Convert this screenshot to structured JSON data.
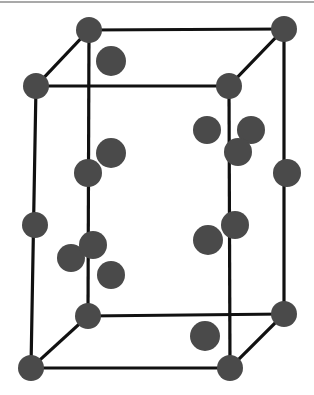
{
  "diagram": {
    "title": "",
    "type": "crystal-unit-cell",
    "colors": {
      "background": "#ffffff",
      "edge": "#111111",
      "atom": "#4a4a4a",
      "top_rule": "#a9a9a9"
    },
    "vertices": {
      "back_top_left": [
        89,
        30
      ],
      "back_top_right": [
        284,
        29
      ],
      "front_top_left": [
        36,
        86
      ],
      "front_top_right": [
        229,
        86
      ],
      "back_bottom_left": [
        88,
        316
      ],
      "back_bottom_right": [
        284,
        314
      ],
      "front_bottom_left": [
        31,
        368
      ],
      "front_bottom_right": [
        230,
        368
      ]
    },
    "edges": [
      [
        "back_top_left",
        "back_top_right"
      ],
      [
        "front_top_left",
        "front_top_right"
      ],
      [
        "back_top_left",
        "front_top_left"
      ],
      [
        "back_top_right",
        "front_top_right"
      ],
      [
        "back_bottom_left",
        "back_bottom_right"
      ],
      [
        "front_bottom_left",
        "front_bottom_right"
      ],
      [
        "back_bottom_left",
        "front_bottom_left"
      ],
      [
        "back_bottom_right",
        "front_bottom_right"
      ],
      [
        "back_top_left",
        "back_bottom_left"
      ],
      [
        "back_top_right",
        "back_bottom_right"
      ],
      [
        "front_top_left",
        "front_bottom_left"
      ],
      [
        "front_top_right",
        "front_bottom_right"
      ]
    ],
    "atoms": [
      {
        "id": "corner-back-top-left",
        "x": 89,
        "y": 30,
        "r": 13
      },
      {
        "id": "corner-back-top-right",
        "x": 284,
        "y": 29,
        "r": 13
      },
      {
        "id": "corner-front-top-left",
        "x": 36,
        "y": 86,
        "r": 13
      },
      {
        "id": "corner-front-top-right",
        "x": 229,
        "y": 86,
        "r": 13
      },
      {
        "id": "corner-back-bottom-left",
        "x": 88,
        "y": 316,
        "r": 13
      },
      {
        "id": "corner-back-bottom-right",
        "x": 284,
        "y": 314,
        "r": 13
      },
      {
        "id": "corner-front-bottom-left",
        "x": 31,
        "y": 368,
        "r": 13
      },
      {
        "id": "corner-front-bottom-right",
        "x": 230,
        "y": 368,
        "r": 13
      },
      {
        "id": "interior-upper-left",
        "x": 111,
        "y": 61,
        "r": 15
      },
      {
        "id": "interior-left-mid-upper",
        "x": 111,
        "y": 153,
        "r": 15
      },
      {
        "id": "edge-back-left-upper",
        "x": 88,
        "y": 173,
        "r": 14
      },
      {
        "id": "interior-right-upper-a",
        "x": 207,
        "y": 130,
        "r": 14
      },
      {
        "id": "interior-right-upper-b",
        "x": 251,
        "y": 130,
        "r": 14
      },
      {
        "id": "edge-front-right-upper",
        "x": 238,
        "y": 152,
        "r": 14
      },
      {
        "id": "edge-back-right-mid",
        "x": 287,
        "y": 173,
        "r": 14
      },
      {
        "id": "edge-front-left-mid",
        "x": 35,
        "y": 225,
        "r": 13
      },
      {
        "id": "interior-left-lower-a",
        "x": 71,
        "y": 258,
        "r": 14
      },
      {
        "id": "edge-back-left-lower",
        "x": 93,
        "y": 245,
        "r": 14
      },
      {
        "id": "interior-left-lower-b",
        "x": 111,
        "y": 275,
        "r": 14
      },
      {
        "id": "interior-right-lower",
        "x": 208,
        "y": 240,
        "r": 15
      },
      {
        "id": "edge-front-right-lower",
        "x": 235,
        "y": 225,
        "r": 14
      },
      {
        "id": "interior-bottom-right",
        "x": 205,
        "y": 336,
        "r": 15
      }
    ]
  }
}
